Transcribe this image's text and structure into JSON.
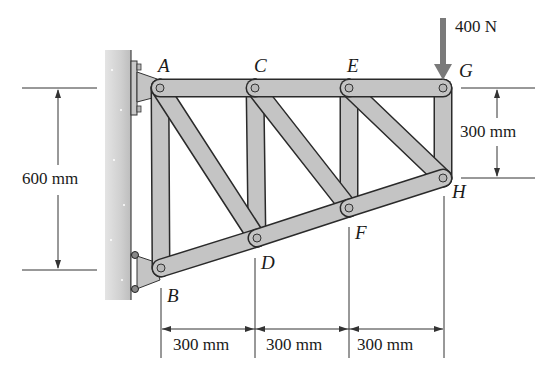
{
  "diagram": {
    "type": "cantilever-truss",
    "joints": {
      "A": {
        "label": "A",
        "x": 160,
        "y": 88
      },
      "B": {
        "label": "B",
        "x": 161,
        "y": 268
      },
      "C": {
        "label": "C",
        "x": 255,
        "y": 88
      },
      "D": {
        "label": "D",
        "x": 257,
        "y": 238
      },
      "E": {
        "label": "E",
        "x": 349,
        "y": 88
      },
      "F": {
        "label": "F",
        "x": 349,
        "y": 208
      },
      "G": {
        "label": "G",
        "x": 443,
        "y": 88
      },
      "H": {
        "label": "H",
        "x": 443,
        "y": 178
      }
    },
    "members": [
      [
        "A",
        "C"
      ],
      [
        "C",
        "E"
      ],
      [
        "E",
        "G"
      ],
      [
        "B",
        "D"
      ],
      [
        "D",
        "F"
      ],
      [
        "F",
        "H"
      ],
      [
        "A",
        "B"
      ],
      [
        "C",
        "D"
      ],
      [
        "E",
        "F"
      ],
      [
        "G",
        "H"
      ],
      [
        "A",
        "D"
      ],
      [
        "C",
        "F"
      ],
      [
        "E",
        "H"
      ]
    ],
    "load": {
      "label": "400 N",
      "at": "G",
      "direction": "down",
      "color": "#7a7a7a"
    },
    "dimensions": {
      "overall_height": "600 mm",
      "right_height": "300 mm",
      "spans": [
        "300 mm",
        "300 mm",
        "300 mm"
      ]
    },
    "colors": {
      "member_fill": "#c4c4c4",
      "member_stroke": "#2a2a2a",
      "wall": "#d6d6d6",
      "dim_line": "#333333"
    }
  }
}
